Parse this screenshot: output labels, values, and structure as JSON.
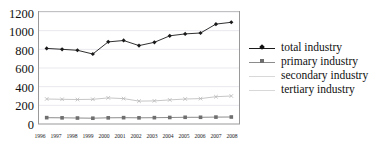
{
  "chart_data": {
    "type": "line",
    "title": "",
    "xlabel": "",
    "ylabel": "",
    "ylim": [
      0,
      1200
    ],
    "yticks": [
      0,
      200,
      400,
      600,
      800,
      1000,
      1200
    ],
    "grid": true,
    "legend_position": "right",
    "categories": [
      "1996",
      "1997",
      "1998",
      "1999",
      "2000",
      "2001",
      "2002",
      "2003",
      "2004",
      "2005",
      "2006",
      "2007",
      "2008"
    ],
    "series": [
      {
        "name": "total industry",
        "marker": "diamond",
        "color": "#1a1a1a",
        "values": [
          810,
          800,
          790,
          750,
          880,
          895,
          840,
          875,
          945,
          965,
          975,
          1070,
          1090
        ]
      },
      {
        "name": "primary  industry",
        "marker": "square",
        "color": "#6f6f6f",
        "values": [
          68,
          66,
          64,
          62,
          66,
          68,
          66,
          68,
          70,
          72,
          72,
          74,
          75
        ]
      },
      {
        "name": "secondary industry",
        "marker": "none",
        "color": "#d0d0d0",
        "values": [
          null,
          null,
          null,
          null,
          null,
          null,
          null,
          null,
          null,
          null,
          null,
          null,
          null
        ]
      },
      {
        "name": "tertiary industry",
        "marker": "cross",
        "color": "#b8b8b8",
        "values": [
          268,
          265,
          262,
          265,
          280,
          272,
          245,
          248,
          258,
          268,
          272,
          292,
          300
        ]
      }
    ]
  },
  "legend": {
    "items": [
      {
        "label": "total industry",
        "marker": "diamond",
        "line": "dark"
      },
      {
        "label": "primary  industry",
        "marker": "square",
        "line": "gray"
      },
      {
        "label": "secondary industry",
        "marker": "none",
        "line": "faint"
      },
      {
        "label": "tertiary industry",
        "marker": "none",
        "line": "faint"
      }
    ]
  }
}
